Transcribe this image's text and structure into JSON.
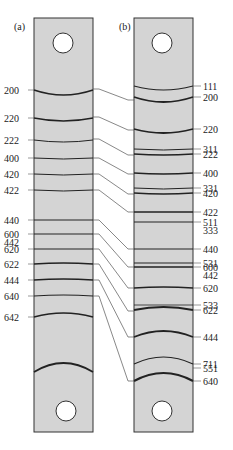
{
  "panels": {
    "a": {
      "label": "(a)"
    },
    "b": {
      "label": "(b)"
    }
  },
  "colors": {
    "strip_fill": "#d4d4d4",
    "strip_edge": "#333333",
    "line": "#222222",
    "connector": "#555555",
    "background": "#ffffff"
  },
  "strip_a": {
    "x": 34,
    "y": 18,
    "w": 59,
    "h": 414,
    "lines": [
      {
        "label": "200",
        "y": 90,
        "curve": 5,
        "w": 1.6
      },
      {
        "label": "220",
        "y": 118,
        "curve": 3,
        "w": 1.6
      },
      {
        "label": "222",
        "y": 140,
        "curve": 2,
        "w": 1.0
      },
      {
        "label": "400",
        "y": 158,
        "curve": 1,
        "w": 1.0
      },
      {
        "label": "420",
        "y": 174,
        "curve": 1,
        "w": 1.0
      },
      {
        "label": "422",
        "y": 190,
        "curve": 1,
        "w": 1.0
      },
      {
        "label": "440",
        "y": 220,
        "curve": 0,
        "w": 1.2
      },
      {
        "label": "600",
        "y": 234,
        "curve": 0,
        "w": 1.2,
        "label2": "442"
      },
      {
        "label": "620",
        "y": 249,
        "curve": 0,
        "w": 1.2
      },
      {
        "label": "622",
        "y": 264,
        "curve": -1,
        "w": 1.6
      },
      {
        "label": "444",
        "y": 280,
        "curve": -1,
        "w": 1.6
      },
      {
        "label": "640",
        "y": 296,
        "curve": -1,
        "w": 1.2
      },
      {
        "label": "642",
        "y": 317,
        "curve": -4,
        "w": 1.6
      }
    ],
    "bottom_curve": {
      "y": 372,
      "curve": -9,
      "w": 1.8
    },
    "holes": [
      {
        "cx": 63,
        "cy": 43,
        "r": 10
      },
      {
        "cx": 66,
        "cy": 411,
        "r": 10
      }
    ]
  },
  "strip_b": {
    "x": 134,
    "y": 18,
    "w": 59,
    "h": 414,
    "lines": [
      {
        "label": "111",
        "y": 86,
        "curve": 4,
        "w": 1.2
      },
      {
        "label": "200",
        "y": 97,
        "curve": 5,
        "w": 1.8
      },
      {
        "label": "220",
        "y": 129,
        "curve": 4,
        "w": 1.8
      },
      {
        "label": "311",
        "y": 149,
        "curve": 1,
        "w": 1.0
      },
      {
        "label": "222",
        "y": 154,
        "curve": 1,
        "w": 1.6
      },
      {
        "label": "400",
        "y": 173,
        "curve": 1,
        "w": 1.6
      },
      {
        "label": "331",
        "y": 188,
        "curve": 1,
        "w": 1.0
      },
      {
        "label": "420",
        "y": 193,
        "curve": 1,
        "w": 1.6
      },
      {
        "label": "422",
        "y": 212,
        "curve": 0,
        "w": 1.6
      },
      {
        "label": "511",
        "y": 222,
        "curve": 0,
        "w": 1.0,
        "label2": "333"
      },
      {
        "label": "440",
        "y": 249,
        "curve": 0,
        "w": 1.2
      },
      {
        "label": "531",
        "y": 263,
        "curve": 0,
        "w": 1.0
      },
      {
        "label": "600",
        "y": 267,
        "curve": 0,
        "w": 1.6,
        "label2": "442"
      },
      {
        "label": "620",
        "y": 288,
        "curve": -1,
        "w": 1.6
      },
      {
        "label": "533",
        "y": 305,
        "curve": 0,
        "w": 0.8
      },
      {
        "label": "622",
        "y": 310,
        "curve": -3,
        "w": 1.8
      },
      {
        "label": "444",
        "y": 337,
        "curve": -6,
        "w": 1.8
      },
      {
        "label": "711",
        "y": 364,
        "curve": -7,
        "w": 1.2
      },
      {
        "label": "551",
        "y": 368,
        "curve": 0,
        "w": 0.0
      },
      {
        "label": "640",
        "y": 381,
        "curve": -8,
        "w": 2.0
      }
    ],
    "holes": [
      {
        "cx": 162,
        "cy": 43,
        "r": 10
      },
      {
        "cx": 162,
        "cy": 411,
        "r": 10
      }
    ]
  },
  "connectors": [
    {
      "from": "200",
      "ya": 89,
      "yb": 100
    },
    {
      "from": "220",
      "ya": 117,
      "yb": 130
    },
    {
      "from": "222",
      "ya": 139,
      "yb": 155
    },
    {
      "from": "400",
      "ya": 158,
      "yb": 174
    },
    {
      "from": "420",
      "ya": 174,
      "yb": 194
    },
    {
      "from": "422",
      "ya": 190,
      "yb": 212
    },
    {
      "from": "440",
      "ya": 220,
      "yb": 249
    },
    {
      "from": "600",
      "ya": 234,
      "yb": 267
    },
    {
      "from": "620",
      "ya": 249,
      "yb": 288
    },
    {
      "from": "622",
      "ya": 264,
      "yb": 311
    },
    {
      "from": "444",
      "ya": 280,
      "yb": 337
    },
    {
      "from": "640",
      "ya": 296,
      "yb": 381
    }
  ]
}
